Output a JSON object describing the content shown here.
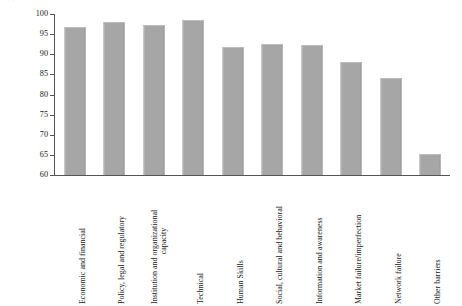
{
  "chart_data": {
    "type": "bar",
    "title": "",
    "xlabel": "",
    "ylabel": "Percentage of all parties",
    "ylim": [
      60,
      100
    ],
    "yticks": [
      60,
      65,
      70,
      75,
      80,
      85,
      90,
      95,
      100
    ],
    "grid": false,
    "legend": "none",
    "orientation": "vertical",
    "bar_color": "#a6a6a6",
    "categories": [
      "Economic and financial",
      "Policy, legal and regulatory",
      "Institution and organizational capacity",
      "Technical",
      "Human Skills",
      "Social, cultural and behavioral",
      "Information and awareness",
      "Market failure/imperfection",
      "Network failure",
      "Other barriers"
    ],
    "values": [
      96.8,
      98.1,
      97.2,
      98.5,
      91.8,
      92.5,
      92.2,
      88.0,
      84.0,
      65.2
    ]
  },
  "axis": {
    "y_title": "Percentage of all parties",
    "y_tick_labels": [
      "100",
      "95",
      "90",
      "85",
      "80",
      "75",
      "70",
      "65",
      "60"
    ]
  },
  "categories": [
    {
      "line1": "Economic and financial",
      "line2": ""
    },
    {
      "line1": "Policy, legal and regulatory",
      "line2": ""
    },
    {
      "line1": "Institution and organizational",
      "line2": "capacity"
    },
    {
      "line1": "Technical",
      "line2": ""
    },
    {
      "line1": "Human Skills",
      "line2": ""
    },
    {
      "line1": "Social, cultural and behavioral",
      "line2": ""
    },
    {
      "line1": "Information and awareness",
      "line2": ""
    },
    {
      "line1": "Market failure/imperfection",
      "line2": ""
    },
    {
      "line1": "Network failure",
      "line2": ""
    },
    {
      "line1": "Other barriers",
      "line2": ""
    }
  ]
}
